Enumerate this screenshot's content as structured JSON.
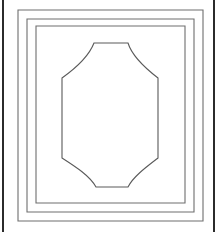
{
  "document": {
    "title": "Nested Frame with Octagonal Center Panel",
    "kind": "line-drawing",
    "width": 218,
    "height": 232,
    "background_color": "#ffffff"
  },
  "palette": {
    "paper": "#ffffff",
    "frame_stroke": "#6e6e6e",
    "frame_stroke_light": "#8a8a8a",
    "panel_stroke": "#5a5a5a",
    "edge_rule": "#2b2b2b"
  },
  "edge_rules": [
    {
      "name": "left-edge-rule",
      "orientation": "vertical",
      "x": 3,
      "y1": 0,
      "y2": 232,
      "width": 2,
      "color": "#2b2b2b"
    },
    {
      "name": "right-edge-rule",
      "orientation": "vertical",
      "x": 214,
      "y1": 0,
      "y2": 232,
      "width": 2,
      "color": "#2b2b2b"
    }
  ],
  "frames": [
    {
      "name": "outer-frame",
      "index": 1,
      "x": 18,
      "y": 10,
      "width": 185,
      "height": 211,
      "stroke": "#6e6e6e",
      "stroke_width": 1.1
    },
    {
      "name": "middle-frame",
      "index": 2,
      "x": 27,
      "y": 19,
      "width": 167,
      "height": 193,
      "stroke": "#6e6e6e",
      "stroke_width": 1.1
    },
    {
      "name": "inner-frame",
      "index": 3,
      "x": 36,
      "y": 26,
      "width": 149,
      "height": 177,
      "stroke": "#6e6e6e",
      "stroke_width": 1.1
    }
  ],
  "panel": {
    "name": "center-octagon-panel",
    "shape": "octagon-concave-corners",
    "stroke": "#5a5a5a",
    "stroke_width": 1.1,
    "fill": "#ffffff",
    "top_edge": {
      "y": 43,
      "x_start": 94,
      "x_end": 128
    },
    "bottom_edge": {
      "y": 187,
      "x_start": 96,
      "x_end": 128
    },
    "left_edge": {
      "x": 62,
      "y_start": 78,
      "y_end": 158
    },
    "right_edge": {
      "x": 158,
      "y_start": 78,
      "y_end": 158
    },
    "corner_style": "concave-arc",
    "path": "M 94 43 L 128 43 C 132 56 145 68 158 78 L 158 158 C 145 168 133 177 128 187 L 96 187 C 90 176 76 167 62 158 L 62 78 C 76 68 89 56 94 43 Z"
  }
}
